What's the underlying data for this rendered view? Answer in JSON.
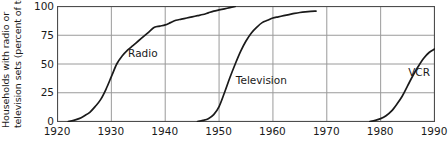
{
  "chart_data": {
    "type": "line",
    "title": "",
    "xlabel": "",
    "ylabel": "Households with radio or television sets (percent of total)",
    "ylabel_line1": "Households with radio or",
    "ylabel_line2": "television sets (percent of total)",
    "xlim": [
      1920,
      1990
    ],
    "ylim": [
      0,
      100
    ],
    "xticks": [
      1920,
      1930,
      1940,
      1950,
      1960,
      1970,
      1980,
      1990
    ],
    "xtick_labels": [
      "1920",
      "1930",
      "1940",
      "1950",
      "1960",
      "1970",
      "1980",
      "1990"
    ],
    "yticks": [
      0,
      25,
      50,
      75,
      100
    ],
    "ytick_labels": [
      "0",
      "25",
      "50",
      "75",
      "100"
    ],
    "grid": "horizontal-and-vertical",
    "legend_position": "inline-annotations",
    "line_color": "#1a1a1a",
    "grid_color": "#9a9a9a",
    "axis_color": "#4d4d4d",
    "background": "#ffffff",
    "series": [
      {
        "name": "Radio",
        "label": "Radio",
        "label_x": 1933.2,
        "label_y": 58,
        "points": [
          [
            1922,
            0
          ],
          [
            1923,
            1
          ],
          [
            1924,
            2.5
          ],
          [
            1925,
            5
          ],
          [
            1926,
            8
          ],
          [
            1927,
            13
          ],
          [
            1928,
            19
          ],
          [
            1929,
            28
          ],
          [
            1930,
            39
          ],
          [
            1931,
            50
          ],
          [
            1932,
            57
          ],
          [
            1933,
            62
          ],
          [
            1934,
            66
          ],
          [
            1935,
            70
          ],
          [
            1936,
            74
          ],
          [
            1937,
            78
          ],
          [
            1938,
            82
          ],
          [
            1939,
            83
          ],
          [
            1940,
            84
          ],
          [
            1941,
            86
          ],
          [
            1942,
            88
          ],
          [
            1943,
            89
          ],
          [
            1944,
            90
          ],
          [
            1945,
            91
          ],
          [
            1946,
            92
          ],
          [
            1947,
            93
          ],
          [
            1948,
            94.5
          ],
          [
            1949,
            96
          ],
          [
            1950,
            97
          ],
          [
            1951,
            98
          ],
          [
            1952,
            99
          ],
          [
            1953,
            100
          ]
        ]
      },
      {
        "name": "Television",
        "label": "Television",
        "label_x": 1953.2,
        "label_y": 35,
        "points": [
          [
            1946,
            0
          ],
          [
            1947,
            1
          ],
          [
            1948,
            2.5
          ],
          [
            1949,
            6
          ],
          [
            1950,
            13
          ],
          [
            1951,
            25
          ],
          [
            1952,
            38
          ],
          [
            1953,
            50
          ],
          [
            1954,
            61
          ],
          [
            1955,
            70
          ],
          [
            1956,
            77
          ],
          [
            1957,
            82
          ],
          [
            1958,
            86
          ],
          [
            1959,
            88
          ],
          [
            1960,
            90
          ],
          [
            1961,
            91
          ],
          [
            1962,
            92
          ],
          [
            1963,
            93
          ],
          [
            1964,
            94
          ],
          [
            1965,
            94.8
          ],
          [
            1966,
            95.4
          ],
          [
            1967,
            95.8
          ],
          [
            1968,
            96
          ]
        ]
      },
      {
        "name": "VCR",
        "label": "VCR",
        "label_x": 1985.2,
        "label_y": 42,
        "points": [
          [
            1978,
            0
          ],
          [
            1979,
            1
          ],
          [
            1980,
            2.5
          ],
          [
            1981,
            5
          ],
          [
            1982,
            9
          ],
          [
            1983,
            15
          ],
          [
            1984,
            22
          ],
          [
            1985,
            31
          ],
          [
            1986,
            40
          ],
          [
            1987,
            48
          ],
          [
            1988,
            55
          ],
          [
            1989,
            60
          ],
          [
            1990,
            63
          ]
        ]
      }
    ]
  }
}
